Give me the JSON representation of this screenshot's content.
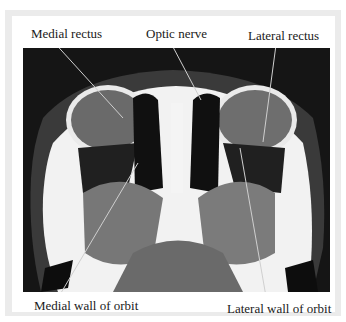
{
  "figure": {
    "type": "axial CT scan of orbits",
    "labels": {
      "medial_rectus": "Medial rectus",
      "optic_nerve": "Optic nerve",
      "lateral_rectus": "Lateral rectus",
      "medial_wall": "Medial wall of orbit",
      "lateral_wall": "Lateral wall of orbit"
    },
    "colors": {
      "background": "#151515",
      "bone": "#f4f4f4",
      "soft_tissue": "#7a7a7a",
      "frame": "#ebebeb",
      "text": "#1a1a1a"
    }
  }
}
